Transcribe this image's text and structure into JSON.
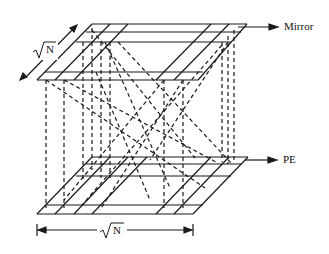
{
  "diagram": {
    "labels": {
      "mirror": "Mirror",
      "pe": "PE",
      "dim_top": "N",
      "dim_bottom": "N"
    },
    "colors": {
      "line": "#1a1a1a",
      "background": "#ffffff"
    }
  }
}
